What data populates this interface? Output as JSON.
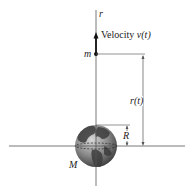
{
  "labels": {
    "axis_r": "r",
    "velocity": "Velocity ",
    "velocity_symbol": "v(t)",
    "mass_small": "m",
    "distance": "r(t)",
    "radius": "R",
    "mass_large": "M"
  },
  "colors": {
    "line": "#555555",
    "arrow": "#111111",
    "globe_light": "#b8b8b8",
    "globe_dark": "#4a4a4a"
  }
}
